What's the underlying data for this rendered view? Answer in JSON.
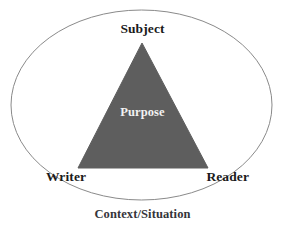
{
  "diagram": {
    "caption": "Context/Situation",
    "shapes": {
      "ellipse": {
        "name": "context-ellipse",
        "cx": 141.5,
        "cy": 105,
        "rx": 130.5,
        "ry": 95,
        "stroke_color": "#8a8a8a",
        "stroke_width": 1,
        "fill": "none"
      },
      "triangle": {
        "name": "purpose-triangle",
        "apex": [
          142,
          43
        ],
        "bottom_left": [
          78,
          168
        ],
        "bottom_right": [
          208,
          168
        ],
        "fill_color": "#5e5e5e",
        "stroke_color": "#5e5e5e"
      }
    },
    "vertices": [
      {
        "id": "subject",
        "label": "Subject",
        "position": "top"
      },
      {
        "id": "writer",
        "label": "Writer",
        "position": "bottom-left"
      },
      {
        "id": "reader",
        "label": "Reader",
        "position": "bottom-right"
      }
    ],
    "center": {
      "id": "purpose",
      "label": "Purpose"
    },
    "colors": {
      "background": "#ffffff",
      "triangle_fill": "#5e5e5e",
      "ellipse_stroke": "#8a8a8a",
      "label_text": "#1b1b1b",
      "center_text": "#f2f2f2",
      "caption_text": "#35353a"
    }
  }
}
